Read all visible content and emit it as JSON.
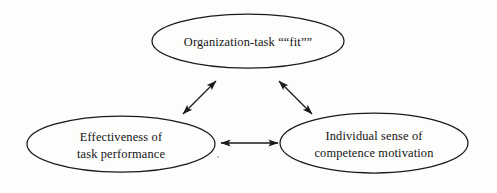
{
  "diagram": {
    "type": "node-link-diagram",
    "background_color": "#fdfdfc",
    "stroke_color": "#1a1a1a",
    "text_color": "#141414",
    "nodes": [
      {
        "id": "org-task-fit",
        "shape": "ellipse",
        "lines": [
          "Organization-task ““fit””"
        ],
        "cx": 248,
        "cy": 41,
        "rx": 96,
        "ry": 27
      },
      {
        "id": "effectiveness-of-task-performance",
        "shape": "ellipse",
        "lines": [
          "Effectiveness of",
          "task performance"
        ],
        "cx": 121,
        "cy": 144,
        "rx": 94,
        "ry": 28
      },
      {
        "id": "individual-sense-of-competence-motivation",
        "shape": "ellipse",
        "lines": [
          "Individual sense of",
          "competence motivation"
        ],
        "cx": 374,
        "cy": 143,
        "rx": 94,
        "ry": 30
      }
    ],
    "edges": [
      {
        "id": "edge-effectiveness-to-fit",
        "from": "effectiveness-of-task-performance",
        "to": "org-task-fit",
        "style": "double-headed-arrow",
        "x1": 183,
        "y1": 114,
        "x2": 216,
        "y2": 81
      },
      {
        "id": "edge-fit-to-individual",
        "from": "org-task-fit",
        "to": "individual-sense-of-competence-motivation",
        "style": "double-headed-arrow",
        "x1": 279,
        "y1": 81,
        "x2": 312,
        "y2": 114
      },
      {
        "id": "edge-effectiveness-to-individual",
        "from": "effectiveness-of-task-performance",
        "to": "individual-sense-of-competence-motivation",
        "style": "double-headed-arrow",
        "x1": 221,
        "y1": 143,
        "x2": 278,
        "y2": 143
      }
    ],
    "artifacts": [
      {
        "id": "scan-speck",
        "cx": 218,
        "cy": 157,
        "r": 1.1
      }
    ]
  }
}
